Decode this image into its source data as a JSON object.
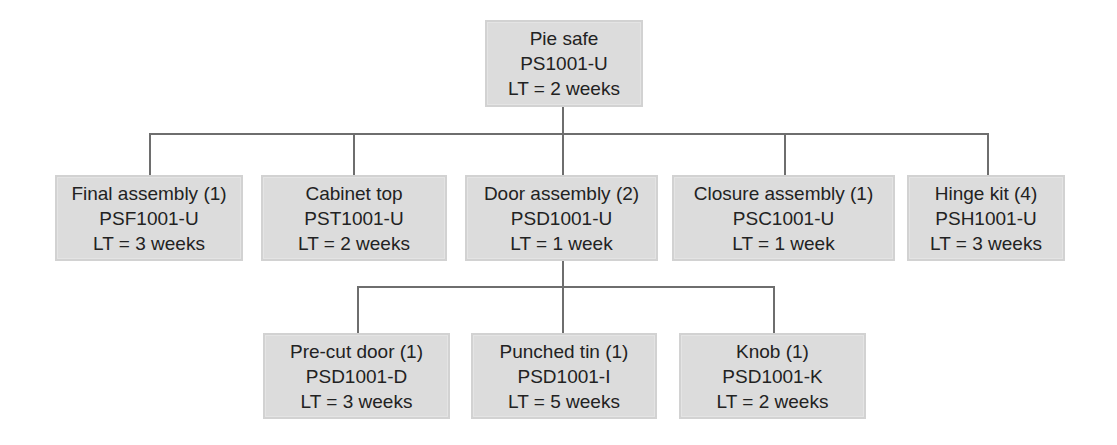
{
  "diagram": {
    "type": "product-structure-tree",
    "colors": {
      "box_fill": "#dcdcdc",
      "line": "#6e6e6e",
      "text": "#222222"
    },
    "root": {
      "name": "Pie safe",
      "part": "PS1001-U",
      "lead_time": "LT = 2 weeks"
    },
    "level1": [
      {
        "name": "Final assembly (1)",
        "part": "PSF1001-U",
        "lead_time": "LT = 3 weeks"
      },
      {
        "name": "Cabinet top",
        "part": "PST1001-U",
        "lead_time": "LT = 2 weeks"
      },
      {
        "name": "Door assembly (2)",
        "part": "PSD1001-U",
        "lead_time": "LT = 1 week"
      },
      {
        "name": "Closure assembly (1)",
        "part": "PSC1001-U",
        "lead_time": "LT = 1 week"
      },
      {
        "name": "Hinge kit (4)",
        "part": "PSH1001-U",
        "lead_time": "LT = 3 weeks"
      }
    ],
    "level2_parent": "Door assembly (2)",
    "level2": [
      {
        "name": "Pre-cut door (1)",
        "part": "PSD1001-D",
        "lead_time": "LT = 3 weeks"
      },
      {
        "name": "Punched tin (1)",
        "part": "PSD1001-I",
        "lead_time": "LT = 5 weeks"
      },
      {
        "name": "Knob (1)",
        "part": "PSD1001-K",
        "lead_time": "LT = 2 weeks"
      }
    ]
  }
}
